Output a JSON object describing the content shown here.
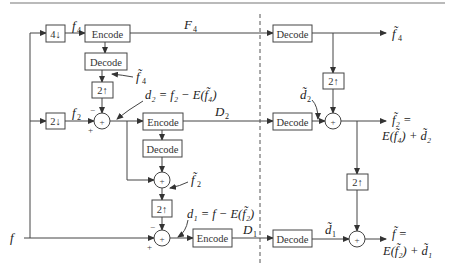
{
  "diagram": {
    "title": "",
    "blocks": {
      "down4": "4↓",
      "down2": "2↓",
      "up2_a": "2↑",
      "up2_b": "2↑",
      "up2_c": "2↑",
      "up2_d": "2↑",
      "encode_1": "Encode",
      "encode_2": "Encode",
      "encode_3": "Encode",
      "decode_1": "Decode",
      "decode_2": "Decode",
      "decode_r1": "Decode",
      "decode_r2": "Decode",
      "decode_r3": "Decode",
      "sum_symbol": "+"
    },
    "labels": {
      "input_f": "f",
      "f4": "f",
      "f4_sub": "4",
      "f2": "f",
      "f2_sub": "2",
      "F4": "F",
      "F4_sub": "4",
      "D2": "D",
      "D2_sub": "2",
      "D1": "D",
      "D1_sub": "1",
      "f4_tilde": "f̃",
      "f4_tilde_sub": "4",
      "f2_tilde": "f̃",
      "f2_tilde_sub": "2",
      "d2_eq": "d₂ = f₂ − E(f̃₄)",
      "d1_eq": "d₁ = f − E(f̃₂)",
      "d2_tilde": "d̃",
      "d2_tilde_sub": "2",
      "d1_tilde": "d̃",
      "d1_tilde_sub": "1",
      "out_f4": "f̃",
      "out_f4_sub": "4",
      "out_f2_line1": "f̃₂ =",
      "out_f2_line2": "E(f̃₄) + d̃₂",
      "out_f_line1": "f̃ =",
      "out_f_line2": "E(f̃₂) + d̃₁",
      "minus": "−",
      "plus": "+"
    }
  }
}
